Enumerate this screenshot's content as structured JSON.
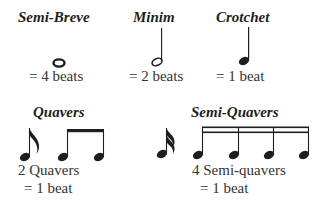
{
  "semibreve": {
    "title": "Semi-Breve",
    "caption": "= 4 beats",
    "beats": 4
  },
  "minim": {
    "title": "Minim",
    "caption": "= 2 beats",
    "beats": 2
  },
  "crotchet": {
    "title": "Crotchet",
    "caption": "= 1 beat",
    "beats": 1
  },
  "quavers": {
    "title": "Quavers",
    "caption_line1": "2 Quavers",
    "caption_line2": "= 1 beat"
  },
  "semiquavers": {
    "title": "Semi-Quavers",
    "caption_line1": "4 Semi-quavers",
    "caption_line2": "= 1 beat"
  },
  "colors": {
    "ink": "#1e1e1e",
    "background": "#ffffff"
  }
}
